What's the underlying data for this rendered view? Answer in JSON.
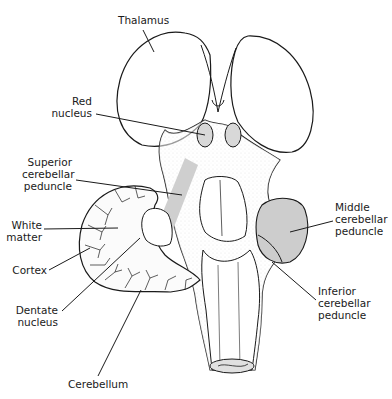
{
  "diagram": {
    "type": "anatomical-illustration",
    "colors": {
      "outline": "#1a1a1a",
      "stipple": "#8a8a8a",
      "highlight_fill": "#cfcfcf",
      "background": "#ffffff"
    },
    "labels": {
      "thalamus": "Thalamus",
      "red_nucleus": "Red\nnucleus",
      "superior_cerebellar_peduncle": "Superior\ncerebellar\npeduncle",
      "white_matter": "White\nmatter",
      "cortex": "Cortex",
      "dentate_nucleus": "Dentate\nnucleus",
      "cerebellum": "Cerebellum",
      "middle_cerebellar_peduncle": "Middle\ncerebellar\npeduncle",
      "inferior_cerebellar_peduncle": "Inferior\ncerebellar\npeduncle"
    }
  }
}
